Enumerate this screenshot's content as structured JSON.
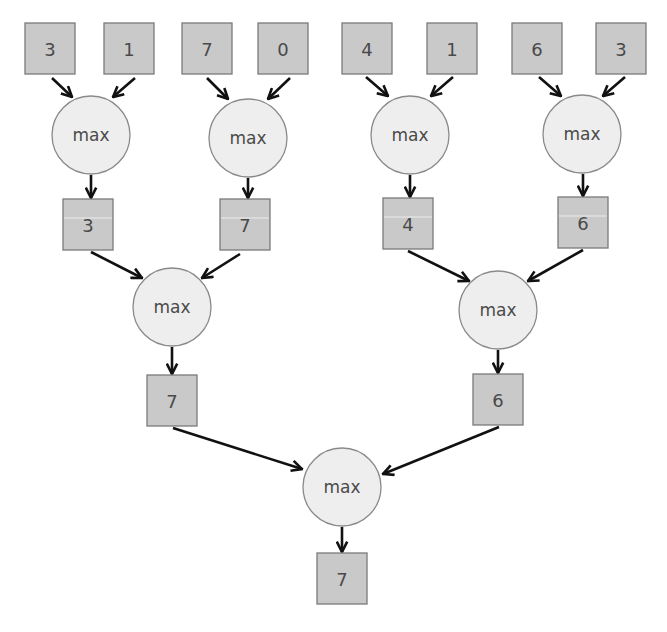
{
  "colors": {
    "value_box_fill": "#c9c9c9",
    "value_box_border": "#7a7a7a",
    "operator_fill": "#eeeeee",
    "operator_border": "#8a8a8a",
    "arrow": "#111111",
    "text": "#4a4a4a"
  },
  "levels": {
    "inputs": [
      "3",
      "1",
      "7",
      "0",
      "4",
      "1",
      "6",
      "3"
    ],
    "level1_results": [
      "3",
      "7",
      "4",
      "6"
    ],
    "level2_results": [
      "7",
      "6"
    ],
    "final_result": "7"
  },
  "operator_label": "max",
  "nodes": {
    "in0": {
      "type": "box",
      "label": "3",
      "x": 25,
      "y": 23
    },
    "in1": {
      "type": "box",
      "label": "1",
      "x": 104,
      "y": 23
    },
    "in2": {
      "type": "box",
      "label": "7",
      "x": 182,
      "y": 23
    },
    "in3": {
      "type": "box",
      "label": "0",
      "x": 258,
      "y": 23
    },
    "in4": {
      "type": "box",
      "label": "4",
      "x": 342,
      "y": 23
    },
    "in5": {
      "type": "box",
      "label": "1",
      "x": 427,
      "y": 23
    },
    "in6": {
      "type": "box",
      "label": "6",
      "x": 512,
      "y": 23
    },
    "in7": {
      "type": "box",
      "label": "3",
      "x": 596,
      "y": 23
    },
    "op1a": {
      "type": "op",
      "label": "max",
      "cx": 91,
      "cy": 135
    },
    "op1b": {
      "type": "op",
      "label": "max",
      "cx": 248,
      "cy": 138
    },
    "op1c": {
      "type": "op",
      "label": "max",
      "cx": 410,
      "cy": 135
    },
    "op1d": {
      "type": "op",
      "label": "max",
      "cx": 582,
      "cy": 134
    },
    "r1a": {
      "type": "box",
      "label": "3",
      "x": 63,
      "y": 199,
      "sheen": true
    },
    "r1b": {
      "type": "box",
      "label": "7",
      "x": 220,
      "y": 199,
      "sheen": true
    },
    "r1c": {
      "type": "box",
      "label": "4",
      "x": 383,
      "y": 198,
      "sheen": true
    },
    "r1d": {
      "type": "box",
      "label": "6",
      "x": 558,
      "y": 197,
      "sheen": true
    },
    "op2a": {
      "type": "op",
      "label": "max",
      "cx": 172,
      "cy": 307
    },
    "op2b": {
      "type": "op",
      "label": "max",
      "cx": 498,
      "cy": 310
    },
    "r2a": {
      "type": "box",
      "label": "7",
      "x": 147,
      "y": 375
    },
    "r2b": {
      "type": "box",
      "label": "6",
      "x": 473,
      "y": 374
    },
    "op3": {
      "type": "op",
      "label": "max",
      "cx": 342,
      "cy": 487
    },
    "final": {
      "type": "box",
      "label": "7",
      "x": 317,
      "y": 553
    }
  },
  "edges": [
    {
      "from": "in0",
      "to": "op1a",
      "x1": 52,
      "y1": 78,
      "x2": 72,
      "y2": 97
    },
    {
      "from": "in1",
      "to": "op1a",
      "x1": 135,
      "y1": 78,
      "x2": 113,
      "y2": 97
    },
    {
      "from": "in2",
      "to": "op1b",
      "x1": 207,
      "y1": 78,
      "x2": 228,
      "y2": 99
    },
    {
      "from": "in3",
      "to": "op1b",
      "x1": 290,
      "y1": 78,
      "x2": 268,
      "y2": 99
    },
    {
      "from": "in4",
      "to": "op1c",
      "x1": 366,
      "y1": 77,
      "x2": 388,
      "y2": 96
    },
    {
      "from": "in5",
      "to": "op1c",
      "x1": 453,
      "y1": 77,
      "x2": 431,
      "y2": 96
    },
    {
      "from": "in6",
      "to": "op1d",
      "x1": 539,
      "y1": 77,
      "x2": 561,
      "y2": 96
    },
    {
      "from": "in7",
      "to": "op1d",
      "x1": 625,
      "y1": 77,
      "x2": 603,
      "y2": 96
    },
    {
      "from": "op1a",
      "to": "r1a",
      "x1": 91,
      "y1": 175,
      "x2": 91,
      "y2": 198
    },
    {
      "from": "op1b",
      "to": "r1b",
      "x1": 248,
      "y1": 178,
      "x2": 248,
      "y2": 198
    },
    {
      "from": "op1c",
      "to": "r1c",
      "x1": 410,
      "y1": 175,
      "x2": 410,
      "y2": 197
    },
    {
      "from": "op1d",
      "to": "r1d",
      "x1": 583,
      "y1": 174,
      "x2": 583,
      "y2": 196
    },
    {
      "from": "r1a",
      "to": "op2a",
      "x1": 91,
      "y1": 252,
      "x2": 142,
      "y2": 278
    },
    {
      "from": "r1b",
      "to": "op2a",
      "x1": 240,
      "y1": 254,
      "x2": 202,
      "y2": 278
    },
    {
      "from": "r1c",
      "to": "op2b",
      "x1": 408,
      "y1": 251,
      "x2": 469,
      "y2": 281
    },
    {
      "from": "r1d",
      "to": "op2b",
      "x1": 583,
      "y1": 250,
      "x2": 528,
      "y2": 281
    },
    {
      "from": "op2a",
      "to": "r2a",
      "x1": 172,
      "y1": 347,
      "x2": 172,
      "y2": 374
    },
    {
      "from": "op2b",
      "to": "r2b",
      "x1": 498,
      "y1": 350,
      "x2": 498,
      "y2": 373
    },
    {
      "from": "r2a",
      "to": "op3",
      "x1": 173,
      "y1": 428,
      "x2": 302,
      "y2": 469
    },
    {
      "from": "r2b",
      "to": "op3",
      "x1": 499,
      "y1": 427,
      "x2": 383,
      "y2": 474
    },
    {
      "from": "op3",
      "to": "final",
      "x1": 342,
      "y1": 527,
      "x2": 342,
      "y2": 552
    }
  ]
}
